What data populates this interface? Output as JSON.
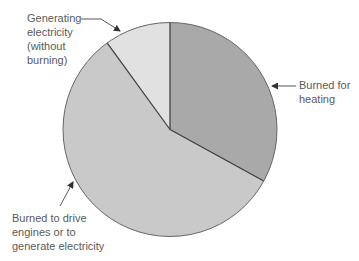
{
  "chart_data": {
    "type": "pie",
    "title": "",
    "slices": [
      {
        "label": "Burned for heating",
        "value": 33,
        "color": "#a9a9a9"
      },
      {
        "label": "Burned to drive engines or to generate electricity",
        "value": 57,
        "color": "#c9c9c9"
      },
      {
        "label": "Generating electricity (without burning)",
        "value": 10,
        "color": "#e1e1e1"
      }
    ],
    "start_angle_deg": -90,
    "direction": "clockwise",
    "legend": "none (callout labels with arrows)",
    "values_estimated": true
  },
  "labels": {
    "heating": [
      "Burned for",
      "heating"
    ],
    "engines": [
      "Burned to drive",
      "engines or to",
      "generate electricity"
    ],
    "nonburning": [
      "Generating",
      "electricity",
      "(without",
      "burning)"
    ]
  },
  "style": {
    "outline_color": "#555555",
    "text_color": "#5a5a5a"
  }
}
